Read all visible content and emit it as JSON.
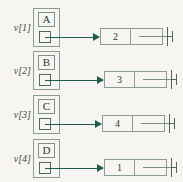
{
  "diagram": {
    "type": "array-of-linked-lists",
    "background_color": "#f6f5f1",
    "border_color": "#8a9c94",
    "arrow_color": "#1f5c50",
    "text_color": "#2d3a35",
    "rows": [
      {
        "index_label": "v[1]",
        "index_var": "v",
        "index_subscript": "[1]",
        "vertex_letter": "A",
        "node_value": "2",
        "next_pointer": "null"
      },
      {
        "index_label": "v[2]",
        "index_var": "v",
        "index_subscript": "[2]",
        "vertex_letter": "B",
        "node_value": "3",
        "next_pointer": "null"
      },
      {
        "index_label": "v[3]",
        "index_var": "v",
        "index_subscript": "[3]",
        "vertex_letter": "C",
        "node_value": "4",
        "next_pointer": "null"
      },
      {
        "index_label": "v[4]",
        "index_var": "v",
        "index_subscript": "[4]",
        "vertex_letter": "D",
        "node_value": "1",
        "next_pointer": "null"
      }
    ]
  }
}
